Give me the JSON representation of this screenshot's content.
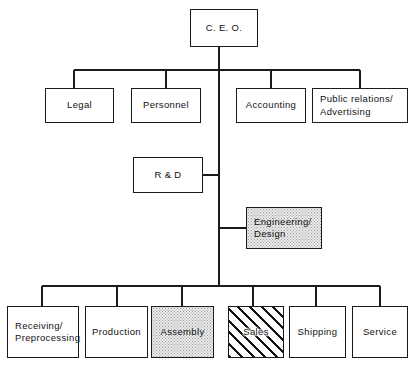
{
  "diagram": {
    "line_color": "#1b1b1b",
    "background": "#ffffff",
    "fills": {
      "stipple": "#ebebeb",
      "hatch": "#111111",
      "plain": "#ffffff"
    }
  },
  "nodes": {
    "ceo": {
      "label": "C. E. O.",
      "fill": "plain",
      "align": "center"
    },
    "legal": {
      "label": "Legal",
      "fill": "plain",
      "align": "center"
    },
    "personnel": {
      "label": "Personnel",
      "fill": "plain",
      "align": "center"
    },
    "accounting": {
      "label": "Accounting",
      "fill": "plain",
      "align": "center"
    },
    "publicrel": {
      "label": "Public relations/\nAdvertising",
      "fill": "plain",
      "align": "left"
    },
    "rnd": {
      "label": "R & D",
      "fill": "plain",
      "align": "center"
    },
    "engineering": {
      "label": "Engineering/\nDesign",
      "fill": "stipple",
      "align": "left"
    },
    "receiving": {
      "label": "Receiving/\nPreprocessing",
      "fill": "plain",
      "align": "left"
    },
    "production": {
      "label": "Production",
      "fill": "plain",
      "align": "center"
    },
    "assembly": {
      "label": "Assembly",
      "fill": "stipple",
      "align": "center"
    },
    "sales": {
      "label": "Sales",
      "fill": "hatch",
      "align": "center"
    },
    "shipping": {
      "label": "Shipping",
      "fill": "plain",
      "align": "center"
    },
    "service": {
      "label": "Service",
      "fill": "plain",
      "align": "center"
    }
  }
}
